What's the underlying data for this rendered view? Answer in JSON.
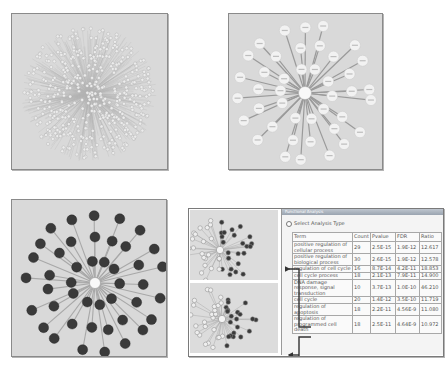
{
  "figure": {
    "panels": [
      {
        "id": "full-network",
        "description": "dense radial gene network",
        "node_style": "light",
        "node_color": "#e8e8e8"
      },
      {
        "id": "labeled-subnetwork",
        "description": "radial subnetwork with labeled light nodes",
        "node_color": "#f2f2f2",
        "hub_label": "TP53"
      },
      {
        "id": "highlighted-subnetwork",
        "description": "radial subnetwork with dark highlighted nodes",
        "node_color": "#3a3a3a"
      },
      {
        "id": "analysis-composite",
        "description": "mini networks linked to enrichment table by arrows"
      }
    ],
    "colors": {
      "panel_bg": "#d9d9d9",
      "edge": "#9e9e9e",
      "dark_node": "#3a3a3a",
      "light_node": "#f2f2f2",
      "arrow": "#333333"
    }
  },
  "dialog": {
    "title": "Functional Analysis",
    "select_label": "Select Analysis Type"
  },
  "table": {
    "headers": [
      "Term",
      "Count",
      "Pvalue",
      "FDR",
      "Ratio"
    ],
    "rows": [
      {
        "term": "positive regulation of cellular process",
        "count": "29",
        "pvalue": "2.5E-15",
        "fdr": "1.9E-12",
        "ratio": "12.617"
      },
      {
        "term": "positive regulation of biological process",
        "count": "30",
        "pvalue": "2.6E-15",
        "fdr": "1.9E-12",
        "ratio": "12.578"
      },
      {
        "term": "regulation of cell cycle",
        "count": "16",
        "pvalue": "8.7E-14",
        "fdr": "4.2E-11",
        "ratio": "18.853"
      },
      {
        "term": "cell cycle process",
        "count": "18",
        "pvalue": "2.1E-13",
        "fdr": "7.9E-11",
        "ratio": "14.900"
      },
      {
        "term": "DNA damage response, signal transduction",
        "count": "10",
        "pvalue": "3.7E-13",
        "fdr": "1.0E-10",
        "ratio": "46.210"
      },
      {
        "term": "cell cycle",
        "count": "20",
        "pvalue": "1.4E-12",
        "fdr": "3.5E-10",
        "ratio": "11.719"
      },
      {
        "term": "regulation of apoptosis",
        "count": "18",
        "pvalue": "2.2E-11",
        "fdr": "4.56E-9",
        "ratio": "11.080"
      },
      {
        "term": "regulation of programmed cell death",
        "count": "18",
        "pvalue": "2.5E-11",
        "fdr": "4.64E-9",
        "ratio": "10.972"
      }
    ]
  }
}
